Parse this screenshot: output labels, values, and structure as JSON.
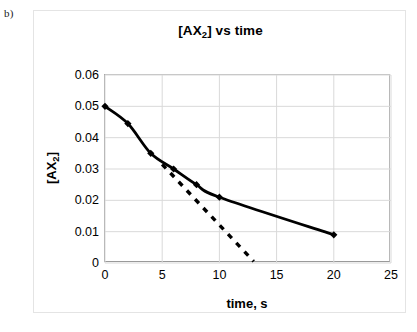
{
  "figure": {
    "label": "b)"
  },
  "chart_data": {
    "type": "line",
    "title": "[AX2] vs time",
    "title_base": "[AX",
    "title_sub": "2",
    "title_tail": "] vs time",
    "xlabel": "time, s",
    "ylabel": "[AX2]",
    "ylabel_base": "[AX",
    "ylabel_sub": "2",
    "ylabel_tail": "]",
    "xlim": [
      0,
      25
    ],
    "ylim": [
      0,
      0.06
    ],
    "xticks": [
      "0",
      "5",
      "10",
      "15",
      "20",
      "25"
    ],
    "xtick_values": [
      0,
      5,
      10,
      15,
      20,
      25
    ],
    "yticks": [
      "0",
      "0.01",
      "0.02",
      "0.03",
      "0.04",
      "0.05",
      "0.06"
    ],
    "ytick_values": [
      0,
      0.01,
      0.02,
      0.03,
      0.04,
      0.05,
      0.06
    ],
    "grid": true,
    "legend": null,
    "series": [
      {
        "name": "[AX2] data",
        "style": "solid-with-markers",
        "color": "#000000",
        "marker": "diamond",
        "x": [
          0,
          2,
          4,
          6,
          8,
          10,
          20
        ],
        "y": [
          0.05,
          0.0445,
          0.035,
          0.03,
          0.025,
          0.021,
          0.009
        ]
      },
      {
        "name": "initial-rate tangent",
        "style": "dashed",
        "color": "#000000",
        "marker": "none",
        "x": [
          5,
          13
        ],
        "y": [
          0.0315,
          0.0005
        ]
      }
    ]
  }
}
